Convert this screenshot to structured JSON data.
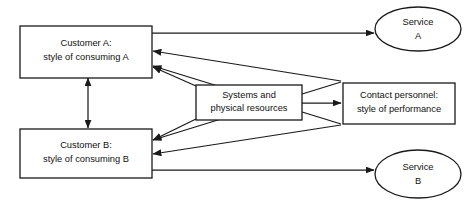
{
  "diagram": {
    "colors": {
      "background": "#ffffff",
      "stroke": "#1a1a1a",
      "text": "#111111"
    },
    "nodes": [
      {
        "id": "customer-a",
        "shape": "rectangle",
        "line1": "Customer A:",
        "line2": "style of consuming A"
      },
      {
        "id": "customer-b",
        "shape": "rectangle",
        "line1": "Customer B:",
        "line2": "style of consuming B"
      },
      {
        "id": "systems-resources",
        "shape": "rectangle",
        "line1": "Systems and",
        "line2": "physical resources"
      },
      {
        "id": "contact-personnel",
        "shape": "rectangle",
        "line1": "Contact personnel:",
        "line2": "style of performance"
      },
      {
        "id": "service-a",
        "shape": "ellipse",
        "line1": "Service",
        "line2": "A"
      },
      {
        "id": "service-b",
        "shape": "ellipse",
        "line1": "Service",
        "line2": "B"
      }
    ],
    "edges": [
      {
        "id": "customer-a-to-service-a",
        "from": "customer-a",
        "to": "service-a",
        "arrows": "end"
      },
      {
        "id": "customer-b-to-service-b",
        "from": "customer-b",
        "to": "service-b",
        "arrows": "end"
      },
      {
        "id": "customer-a-to-customer-b",
        "from": "customer-a",
        "to": "customer-b",
        "arrows": "both"
      },
      {
        "id": "customer-a-to-contact-personnel",
        "from": "customer-a",
        "to": "contact-personnel",
        "arrows": "both"
      },
      {
        "id": "customer-b-to-contact-personnel",
        "from": "customer-b",
        "to": "contact-personnel",
        "arrows": "both"
      },
      {
        "id": "systems-to-customer-a",
        "from": "systems-resources",
        "to": "customer-a",
        "arrows": "end"
      },
      {
        "id": "systems-to-customer-b",
        "from": "systems-resources",
        "to": "customer-b",
        "arrows": "end"
      },
      {
        "id": "systems-to-contact-personnel",
        "from": "systems-resources",
        "to": "contact-personnel",
        "arrows": "end"
      }
    ]
  }
}
